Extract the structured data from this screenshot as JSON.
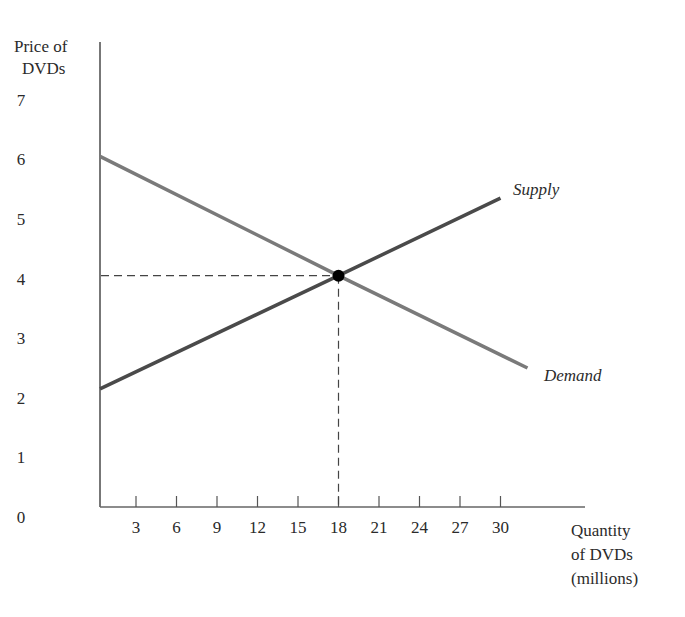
{
  "chart_data": {
    "type": "line",
    "title": "",
    "ylabel": "Price of DVDs",
    "xlabel": "Quantity of DVDs (millions)",
    "ylabel_lines": [
      "Price of",
      "DVDs"
    ],
    "xlabel_lines": [
      "Quantity",
      "of DVDs",
      "(millions)"
    ],
    "y_ticks": [
      "0",
      "1",
      "2",
      "3",
      "4",
      "5",
      "6",
      "7"
    ],
    "x_ticks": [
      "3",
      "6",
      "9",
      "12",
      "15",
      "18",
      "21",
      "24",
      "27",
      "30"
    ],
    "xlim": [
      0,
      36
    ],
    "ylim": [
      0,
      8
    ],
    "grid": false,
    "legend": "inline labels at line ends",
    "series": [
      {
        "name": "Supply",
        "color": "#4a4a4a",
        "points": [
          [
            0,
            2.2
          ],
          [
            18,
            4.1
          ],
          [
            30,
            5.4
          ]
        ]
      },
      {
        "name": "Demand",
        "color": "#7a7a7a",
        "points": [
          [
            0,
            6.1
          ],
          [
            18,
            4.1
          ],
          [
            32,
            2.55
          ]
        ]
      }
    ],
    "annotations": [
      {
        "type": "equilibrium-point",
        "x": 18,
        "y": 4.1,
        "dashed_guides": true
      }
    ]
  },
  "labels": {
    "y_title_1": "Price of",
    "y_title_2": "DVDs",
    "x_title_1": "Quantity",
    "x_title_2": "of DVDs",
    "x_title_3": "(millions)",
    "supply": "Supply",
    "demand": "Demand",
    "origin": "0"
  }
}
